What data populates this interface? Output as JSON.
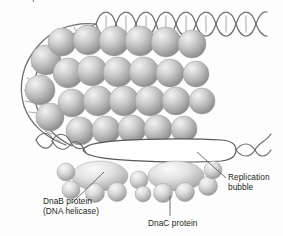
{
  "figure": {
    "name": "dna-replication-initiation-diagram",
    "top_caption_partial": "...of a replication bubble.",
    "background_color": "#fdfdfd",
    "ink_color": "#231f20",
    "sphere_color": "#b8b8b8",
    "helix_color": "#6e6e6e"
  },
  "labels": {
    "dnab_line1": "DnaB protein",
    "dnab_line2": "(DNA helicase)",
    "dnac": "DnaC protein",
    "bubble_line1": "Replication",
    "bubble_line2": "bubble"
  },
  "elements": {
    "dna_helix_top": "dna-double-helix-top",
    "dna_helix_loop": "dna-double-helix-left-loop",
    "protein_cluster": "dnaa-protein-sphere-cluster",
    "replication_bubble": "replication-bubble-lens",
    "helicase_left": "dnab-helicase-ellipse-left",
    "helicase_right": "dnab-helicase-ellipse-right",
    "dnac_spheres": "dnac-protein-spheres"
  }
}
